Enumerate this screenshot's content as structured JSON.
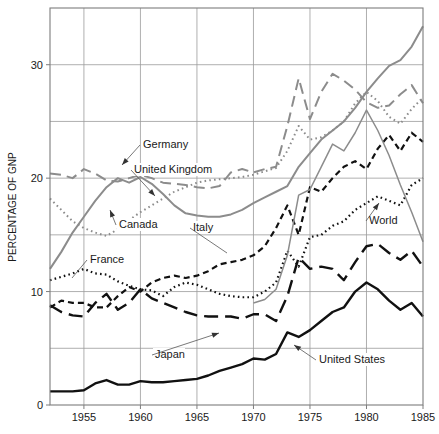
{
  "chart_data": {
    "type": "line",
    "title": "",
    "xlabel": "",
    "ylabel": "PERCENTAGE OF GNP",
    "xlim": [
      1952,
      1985
    ],
    "ylim": [
      0,
      35
    ],
    "yticks": [
      0,
      10,
      20,
      30
    ],
    "ygridlines": [
      0,
      5,
      10,
      15,
      20,
      25,
      30
    ],
    "xticks": [
      1955,
      1960,
      1965,
      1970,
      1975,
      1980,
      1985
    ],
    "xtick_labels": [
      "1955",
      "1960",
      "1965",
      "1970",
      "1975",
      "1980",
      "1985"
    ],
    "ytick_labels": [
      "0",
      "10",
      "20",
      "30"
    ],
    "grid": true,
    "legend": "inline-annotations",
    "x": [
      1952,
      1953,
      1954,
      1955,
      1956,
      1957,
      1958,
      1959,
      1960,
      1961,
      1962,
      1963,
      1964,
      1965,
      1966,
      1967,
      1968,
      1969,
      1970,
      1971,
      1972,
      1973,
      1974,
      1975,
      1976,
      1977,
      1978,
      1979,
      1980,
      1981,
      1982,
      1983,
      1984,
      1985
    ],
    "series": [
      {
        "name": "Germany",
        "style": "solid",
        "color": "#8c8c8c",
        "width": 2.0,
        "values": [
          12.0,
          13.5,
          15.2,
          16.6,
          18.0,
          19.2,
          20.0,
          19.6,
          20.1,
          19.5,
          18.6,
          17.6,
          16.9,
          16.7,
          16.6,
          16.6,
          16.8,
          17.2,
          17.8,
          18.3,
          18.8,
          19.3,
          21.0,
          22.2,
          23.4,
          24.2,
          25.0,
          26.2,
          27.6,
          28.8,
          29.9,
          30.4,
          31.6,
          33.4
        ]
      },
      {
        "name": "United Kingdom",
        "style": "dashed",
        "color": "#8c8c8c",
        "width": 2.0,
        "values": [
          20.4,
          20.3,
          20.0,
          20.8,
          20.4,
          19.8,
          19.7,
          20.0,
          20.3,
          20.0,
          19.6,
          19.5,
          19.4,
          19.2,
          19.1,
          19.3,
          20.5,
          20.8,
          20.5,
          20.8,
          21.0,
          24.6,
          28.8,
          25.2,
          27.6,
          29.2,
          28.6,
          27.8,
          26.7,
          26.2,
          26.4,
          27.4,
          28.2,
          26.6
        ]
      },
      {
        "name": "Canada",
        "style": "dotted",
        "color": "#8c8c8c",
        "width": 2.0,
        "values": [
          18.2,
          17.2,
          16.2,
          15.6,
          15.2,
          14.9,
          15.5,
          16.3,
          17.0,
          17.6,
          18.2,
          18.8,
          19.2,
          19.6,
          19.8,
          19.9,
          20.0,
          20.1,
          20.3,
          20.6,
          20.9,
          22.4,
          24.6,
          23.4,
          23.6,
          24.2,
          25.0,
          26.6,
          27.6,
          26.8,
          25.4,
          24.8,
          26.1,
          27.1
        ]
      },
      {
        "name": "Italy",
        "style": "dashed-short",
        "color": "#111111",
        "width": 2.2,
        "values": [
          8.6,
          9.2,
          9.0,
          9.0,
          8.6,
          8.6,
          9.6,
          10.4,
          10.0,
          10.8,
          11.2,
          11.4,
          11.2,
          11.4,
          11.8,
          12.4,
          12.6,
          12.8,
          13.2,
          14.0,
          15.6,
          17.6,
          15.0,
          19.2,
          18.8,
          20.0,
          21.0,
          21.5,
          20.8,
          22.6,
          23.8,
          22.4,
          24.0,
          23.2
        ]
      },
      {
        "name": "France",
        "style": "dotted",
        "color": "#111111",
        "width": 2.2,
        "values": [
          11.0,
          11.3,
          11.6,
          12.0,
          11.6,
          11.5,
          10.9,
          10.5,
          10.2,
          10.1,
          9.6,
          10.4,
          10.8,
          10.6,
          10.2,
          9.8,
          9.6,
          9.5,
          9.5,
          10.0,
          10.8,
          13.6,
          12.2,
          14.8,
          15.0,
          15.8,
          16.2,
          17.2,
          17.8,
          18.4,
          18.0,
          17.6,
          19.4,
          20.0
        ]
      },
      {
        "name": "World",
        "style": "solid",
        "color": "#8c8c8c",
        "width": 1.5,
        "values": [
          null,
          null,
          null,
          null,
          null,
          null,
          null,
          null,
          null,
          null,
          null,
          null,
          null,
          null,
          null,
          null,
          null,
          null,
          9.0,
          9.3,
          10.2,
          13.2,
          18.5,
          19.0,
          21.0,
          23.0,
          22.4,
          24.0,
          26.0,
          24.2,
          22.0,
          19.4,
          17.0,
          14.4
        ]
      },
      {
        "name": "Japan",
        "style": "long-dash",
        "color": "#111111",
        "width": 2.4,
        "values": [
          8.8,
          8.2,
          7.9,
          7.8,
          9.0,
          9.8,
          8.4,
          9.0,
          10.2,
          9.4,
          9.0,
          8.6,
          8.2,
          7.9,
          7.8,
          7.8,
          7.8,
          7.6,
          8.0,
          8.0,
          7.4,
          9.6,
          13.0,
          12.0,
          12.2,
          12.0,
          11.0,
          12.6,
          14.0,
          14.2,
          13.4,
          12.8,
          13.6,
          12.2
        ]
      },
      {
        "name": "United States",
        "style": "solid",
        "color": "#111111",
        "width": 2.4,
        "values": [
          1.2,
          1.2,
          1.2,
          1.3,
          1.9,
          2.2,
          1.8,
          1.8,
          2.1,
          2.0,
          2.0,
          2.1,
          2.2,
          2.3,
          2.6,
          3.0,
          3.3,
          3.6,
          4.1,
          4.0,
          4.5,
          6.4,
          6.0,
          6.6,
          7.4,
          8.2,
          8.6,
          10.0,
          10.8,
          10.2,
          9.2,
          8.4,
          9.0,
          7.8
        ]
      }
    ],
    "annotations": [
      {
        "name": "Germany",
        "label": "Germany",
        "tx": 143,
        "ty": 148,
        "ax": 122,
        "ay": 165,
        "anchor": "start",
        "arrow": true
      },
      {
        "name": "United Kingdom",
        "label": "United Kingdom",
        "tx": 134,
        "ty": 173,
        "ax": 155,
        "ay": 196,
        "anchor": "start",
        "arrow": true
      },
      {
        "name": "Canada",
        "label": "Canada",
        "tx": 119,
        "ty": 228,
        "ax": 110,
        "ay": 210,
        "anchor": "start",
        "arrow": true
      },
      {
        "name": "Italy",
        "label": "Italy",
        "tx": 193,
        "ty": 231,
        "ax": 227,
        "ay": 253,
        "anchor": "start",
        "arrow": false
      },
      {
        "name": "France",
        "label": "France",
        "tx": 90,
        "ty": 263,
        "ax": 72,
        "ay": 278,
        "anchor": "start",
        "arrow": false
      },
      {
        "name": "World",
        "label": "World",
        "tx": 369,
        "ty": 224,
        "ax": 379,
        "ay": 203,
        "anchor": "start",
        "arrow": true
      },
      {
        "name": "Japan",
        "label": "Japan",
        "tx": 155,
        "ty": 358,
        "ax": 219,
        "ay": 333,
        "anchor": "start",
        "arrow": true
      },
      {
        "name": "United States",
        "label": "United States",
        "tx": 319,
        "ty": 363,
        "ax": 294,
        "ay": 345,
        "anchor": "start",
        "arrow": true
      }
    ]
  },
  "figure": {
    "ylabel": "PERCENTAGE OF GNP"
  }
}
